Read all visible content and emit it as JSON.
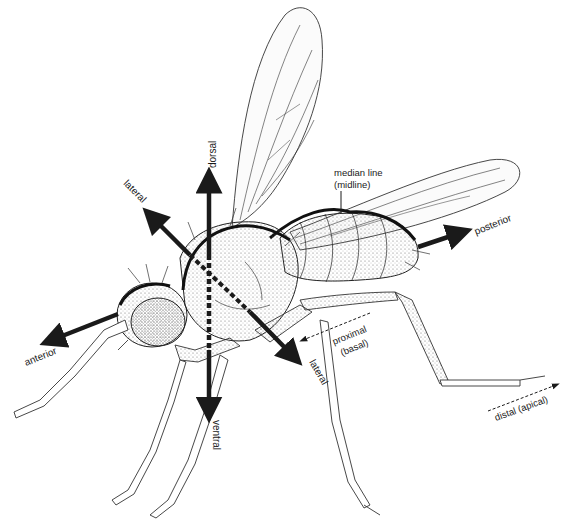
{
  "diagram": {
    "labels": {
      "dorsal": "dorsal",
      "ventral": "ventral",
      "lateral_upper": "lateral",
      "lateral_lower": "lateral",
      "anterior": "anterior",
      "posterior": "posterior",
      "median_line": "median line",
      "median_line_alt": "(midline)",
      "proximal": "proximal",
      "proximal_alt": "(basal)",
      "distal": "distal (apical)"
    },
    "colors": {
      "ink": "#1a1a1a",
      "background": "#ffffff",
      "stipple": "#8a8a8a"
    }
  }
}
